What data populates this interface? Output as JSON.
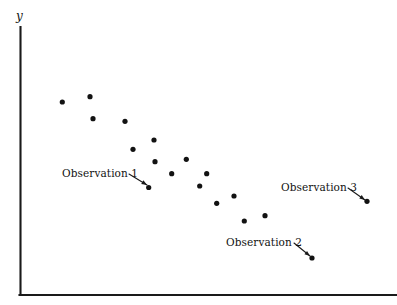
{
  "figure": {
    "background_color": "#ffffff",
    "width": 397,
    "height": 305
  },
  "axes": {
    "y_label": "y",
    "x_label": "",
    "axis_color": "#1a1a1a",
    "y_axis": {
      "x": 20.5,
      "y_top": 27,
      "y_bottom": 295
    },
    "x_axis": {
      "y": 295,
      "x_left": 20.5,
      "x_right": 397
    }
  },
  "annotations": [
    {
      "id": "observation-1",
      "label": "Observation 1",
      "text_x": 62,
      "text_y": 168,
      "line_x1": 129,
      "line_y1": 174,
      "line_x2": 147,
      "line_y2": 185
    },
    {
      "id": "observation-2",
      "label": "Observation 2",
      "text_x": 226,
      "text_y": 237,
      "line_x1": 294,
      "line_y1": 243,
      "line_x2": 310,
      "line_y2": 256
    },
    {
      "id": "observation-3",
      "label": "Observation 3",
      "text_x": 281,
      "text_y": 182,
      "line_x1": 348,
      "line_y1": 188,
      "line_x2": 365,
      "line_y2": 200
    }
  ],
  "chart_data": {
    "type": "scatter",
    "title": "",
    "subtitle": "",
    "xlabel": "",
    "ylabel": "y",
    "grid": false,
    "legend": null,
    "marker_color": "#121212",
    "marker_radius_px": 2.6,
    "axis_ranges": {
      "x_pixel": [
        20.5,
        397
      ],
      "y_pixel": [
        295,
        27
      ]
    },
    "note": "Downward-sloping (negative) relationship; three labelled outlier/observation points annotated with leader arrows.",
    "points_pixel": [
      {
        "x": 62.3,
        "y": 102.0
      },
      {
        "x": 90.0,
        "y": 96.7
      },
      {
        "x": 93.0,
        "y": 118.7
      },
      {
        "x": 125.0,
        "y": 121.3
      },
      {
        "x": 133.0,
        "y": 149.3
      },
      {
        "x": 154.0,
        "y": 140.0
      },
      {
        "x": 148.7,
        "y": 187.5
      },
      {
        "x": 155.0,
        "y": 161.7
      },
      {
        "x": 171.7,
        "y": 173.7
      },
      {
        "x": 186.3,
        "y": 159.3
      },
      {
        "x": 199.7,
        "y": 186.0
      },
      {
        "x": 206.7,
        "y": 173.7
      },
      {
        "x": 216.7,
        "y": 203.3
      },
      {
        "x": 234.0,
        "y": 196.0
      },
      {
        "x": 244.3,
        "y": 221.0
      },
      {
        "x": 265.0,
        "y": 215.7
      },
      {
        "x": 312.0,
        "y": 258.0
      },
      {
        "x": 367.0,
        "y": 201.3
      }
    ],
    "points_data": [
      {
        "x": 1.0,
        "y": 9.3,
        "label": ""
      },
      {
        "x": 1.7,
        "y": 9.5,
        "label": ""
      },
      {
        "x": 1.8,
        "y": 8.7,
        "label": ""
      },
      {
        "x": 2.6,
        "y": 8.6,
        "label": ""
      },
      {
        "x": 2.8,
        "y": 7.6,
        "label": ""
      },
      {
        "x": 3.3,
        "y": 7.9,
        "label": ""
      },
      {
        "x": 3.2,
        "y": 6.1,
        "label": "Observation 1"
      },
      {
        "x": 3.4,
        "y": 7.1,
        "label": ""
      },
      {
        "x": 3.8,
        "y": 6.6,
        "label": ""
      },
      {
        "x": 4.2,
        "y": 7.2,
        "label": ""
      },
      {
        "x": 4.5,
        "y": 6.2,
        "label": ""
      },
      {
        "x": 4.7,
        "y": 6.6,
        "label": ""
      },
      {
        "x": 4.9,
        "y": 5.5,
        "label": ""
      },
      {
        "x": 5.4,
        "y": 5.8,
        "label": ""
      },
      {
        "x": 5.6,
        "y": 4.9,
        "label": ""
      },
      {
        "x": 6.1,
        "y": 5.1,
        "label": ""
      },
      {
        "x": 7.3,
        "y": 3.5,
        "label": "Observation 2"
      },
      {
        "x": 8.7,
        "y": 5.6,
        "label": "Observation 3"
      }
    ]
  }
}
